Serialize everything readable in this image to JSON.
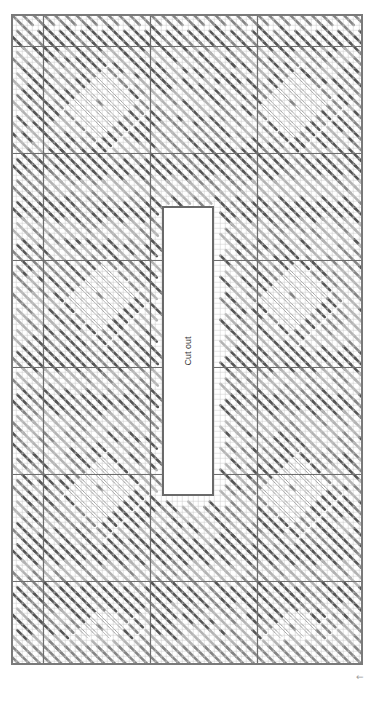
{
  "diagram": {
    "type": "needlepoint-stitch-chart",
    "orientation": "rotated-90",
    "grid": {
      "cell_px": 5.35,
      "columns": 66,
      "rows": 122,
      "major_every": 20,
      "major_offset_cols": 6,
      "major_offset_rows": 6,
      "minor_line_color": "#c8c8c8",
      "major_line_color": "#6e6e6e",
      "border_color": "#7a7a7a"
    },
    "palette": {
      "dark": "#555555",
      "medium": "#858585",
      "light": "#b3b3b3",
      "outline": "#9a9a9a",
      "background": "#ffffff"
    },
    "stitch_bands": [
      {
        "row_start": 0,
        "row_end": 2,
        "tone": "medium",
        "style": "short"
      },
      {
        "row_start": 2,
        "row_end": 6,
        "tone": "dark",
        "style": "long"
      },
      {
        "row_start": 6,
        "row_end": 26,
        "tone": "motif",
        "style": "diamond"
      },
      {
        "row_start": 26,
        "row_end": 30,
        "tone": "dark",
        "style": "long"
      },
      {
        "row_start": 30,
        "row_end": 34,
        "tone": "light",
        "style": "long"
      },
      {
        "row_start": 34,
        "row_end": 38,
        "tone": "dark",
        "style": "long"
      },
      {
        "row_start": 38,
        "row_end": 42,
        "tone": "light",
        "style": "long"
      },
      {
        "row_start": 42,
        "row_end": 62,
        "tone": "motif",
        "style": "diamond"
      },
      {
        "row_start": 62,
        "row_end": 66,
        "tone": "dark",
        "style": "long"
      },
      {
        "row_start": 66,
        "row_end": 70,
        "tone": "light",
        "style": "long"
      },
      {
        "row_start": 70,
        "row_end": 74,
        "tone": "dark",
        "style": "long"
      },
      {
        "row_start": 74,
        "row_end": 78,
        "tone": "light",
        "style": "long"
      },
      {
        "row_start": 78,
        "row_end": 98,
        "tone": "motif",
        "style": "diamond"
      },
      {
        "row_start": 98,
        "row_end": 102,
        "tone": "dark",
        "style": "long"
      },
      {
        "row_start": 102,
        "row_end": 106,
        "tone": "light",
        "style": "long"
      },
      {
        "row_start": 106,
        "row_end": 110,
        "tone": "dark",
        "style": "long"
      },
      {
        "row_start": 110,
        "row_end": 116,
        "tone": "motif",
        "style": "diamond"
      },
      {
        "row_start": 116,
        "row_end": 118,
        "tone": "light",
        "style": "long"
      },
      {
        "row_start": 118,
        "row_end": 122,
        "tone": "medium",
        "style": "short"
      }
    ],
    "motifs": [
      {
        "center_col": 16,
        "center_row": 16,
        "radius": 6
      },
      {
        "center_col": 52,
        "center_row": 16,
        "radius": 6
      },
      {
        "center_col": 16,
        "center_row": 52,
        "radius": 6
      },
      {
        "center_col": 52,
        "center_row": 52,
        "radius": 6
      },
      {
        "center_col": 16,
        "center_row": 88,
        "radius": 6
      },
      {
        "center_col": 52,
        "center_row": 88,
        "radius": 6
      },
      {
        "center_col": 16,
        "center_row": 114,
        "radius": 5
      },
      {
        "center_col": 52,
        "center_row": 114,
        "radius": 5
      }
    ],
    "cutout": {
      "label": "Cut out",
      "col_start": 28,
      "col_end": 38,
      "row_start": 36,
      "row_end": 90
    },
    "orientation_mark": "↑"
  }
}
